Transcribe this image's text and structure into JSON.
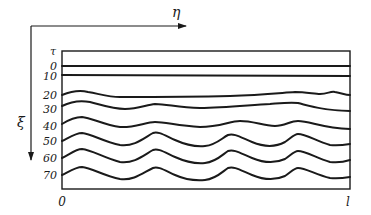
{
  "diagram": {
    "axes": {
      "horizontal_label": "η",
      "vertical_label": "ξ",
      "row_header": "τ",
      "x_start": "0",
      "x_end": "l"
    },
    "rows": [
      {
        "tau": "0"
      },
      {
        "tau": "10"
      },
      {
        "tau": "20"
      },
      {
        "tau": "30"
      },
      {
        "tau": "40"
      },
      {
        "tau": "50"
      },
      {
        "tau": "60"
      },
      {
        "tau": "70"
      }
    ],
    "colors": {
      "ink": "#1a1a1a",
      "background": "#ffffff"
    }
  }
}
